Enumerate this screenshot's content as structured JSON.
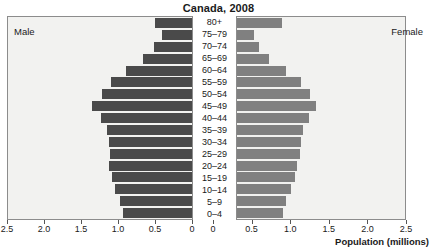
{
  "chart_data": {
    "type": "bar",
    "subtype": "population-pyramid",
    "title": "Canada, 2008",
    "xlabel": "Population (millions)",
    "ylabel": "",
    "categories": [
      "80+",
      "75–79",
      "70–74",
      "65–69",
      "60–64",
      "55–59",
      "50–54",
      "45–49",
      "40–44",
      "35–39",
      "30–34",
      "25–29",
      "20–24",
      "15–19",
      "10–14",
      "5–9",
      "0–4"
    ],
    "series": [
      {
        "name": "Male",
        "side": "left",
        "color": "#4a4a4a",
        "values": [
          0.52,
          0.42,
          0.53,
          0.67,
          0.9,
          1.11,
          1.23,
          1.37,
          1.25,
          1.16,
          1.13,
          1.12,
          1.13,
          1.1,
          1.05,
          0.98,
          0.95
        ]
      },
      {
        "name": "Female",
        "side": "right",
        "color": "#808080",
        "values": [
          0.88,
          0.52,
          0.58,
          0.71,
          0.93,
          1.13,
          1.24,
          1.32,
          1.23,
          1.15,
          1.13,
          1.11,
          1.08,
          1.05,
          1.0,
          0.93,
          0.9
        ]
      }
    ],
    "xlim": [
      0,
      2.5
    ],
    "ticks": [
      2.5,
      2.0,
      1.5,
      1.0,
      0.5,
      0
    ],
    "tick_labels_left": [
      "2.5",
      "2.0",
      "1.5",
      "1.0",
      "0.5",
      "0"
    ],
    "tick_labels_right": [
      "0",
      "0.5",
      "1.0",
      "1.5",
      "2.0",
      "2.5"
    ],
    "grid": false,
    "legend": "side-captions"
  },
  "captions": {
    "male": "Male",
    "female": "Female"
  },
  "colors": {
    "male_bar": "#4a4a4a",
    "female_bar": "#808080",
    "plot_background": "#f2f2f0",
    "frame": "#8c8c8c"
  }
}
